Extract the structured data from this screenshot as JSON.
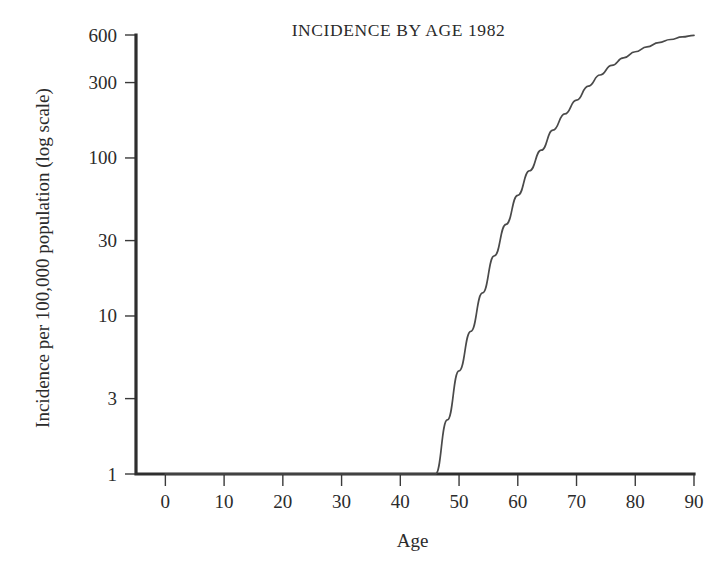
{
  "chart_data": {
    "type": "line",
    "title": "INCIDENCE BY AGE 1982",
    "xlabel": "Age",
    "ylabel": "Incidence per 100,000 population (log scale)",
    "yscale": "log",
    "xscale": "linear",
    "xlim": [
      -5,
      90
    ],
    "ylim": [
      1,
      600
    ],
    "grid": false,
    "legend": null,
    "xticks": [
      0,
      10,
      20,
      30,
      40,
      50,
      60,
      70,
      80,
      90
    ],
    "xtick_labels": [
      "0",
      "10",
      "20",
      "30",
      "40",
      "50",
      "60",
      "70",
      "80",
      "90"
    ],
    "yticks": [
      1,
      3,
      10,
      30,
      100,
      300,
      600
    ],
    "ytick_labels": [
      "1",
      "3",
      "10",
      "30",
      "100",
      "300",
      "600"
    ],
    "series": [
      {
        "name": "Incidence",
        "x": [
          0,
          10,
          20,
          30,
          40,
          44,
          46,
          48,
          50,
          52,
          54,
          56,
          58,
          60,
          62,
          64,
          66,
          68,
          70,
          72,
          74,
          76,
          78,
          80,
          82,
          84,
          86,
          88,
          90
        ],
        "y": [
          1,
          1,
          1,
          1,
          1,
          1,
          1,
          2.2,
          4.5,
          8,
          14,
          24,
          38,
          58,
          83,
          112,
          150,
          190,
          232,
          285,
          335,
          385,
          430,
          470,
          505,
          537,
          562,
          583,
          597
        ]
      }
    ],
    "annotations": []
  },
  "figure": {
    "background_color": "#ffffff",
    "line_color": "#4a4a4a",
    "axis_color": "#2e2e2e",
    "text_color": "#2b2b2b"
  }
}
